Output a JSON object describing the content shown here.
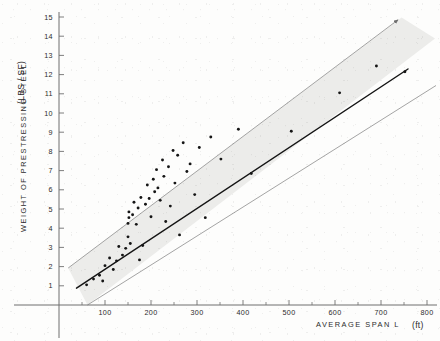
{
  "chart_data": {
    "type": "scatter",
    "title": "",
    "xlabel": "AVERAGE SPAN  L",
    "xunit": "(ft)",
    "ylabel": "WEIGHT OF PRESTRESSING STEEL",
    "yunit": "(LBS / SF)",
    "xlim": [
      0,
      800
    ],
    "ylim": [
      0,
      15
    ],
    "xticks": [
      100,
      200,
      300,
      400,
      500,
      600,
      700,
      800
    ],
    "xtick_labels": [
      "100",
      "200",
      "300",
      "400",
      "500",
      "600",
      "700",
      "800"
    ],
    "yticks": [
      1,
      2,
      3,
      4,
      5,
      6,
      7,
      8,
      9,
      10,
      11,
      12,
      13,
      14,
      15
    ],
    "ytick_labels": [
      "1",
      "2",
      "3",
      "4",
      "5",
      "6",
      "7",
      "8",
      "9",
      "10",
      "11",
      "12",
      "13",
      "14",
      "15"
    ],
    "x_minor_tick_step": 50,
    "grid": false,
    "legend": false,
    "series": [
      {
        "name": "observations",
        "marker": "filled-circle",
        "color": "#151515",
        "points": [
          [
            60,
            1.05
          ],
          [
            75,
            1.35
          ],
          [
            88,
            1.55
          ],
          [
            95,
            1.25
          ],
          [
            100,
            2.05
          ],
          [
            110,
            2.45
          ],
          [
            118,
            1.85
          ],
          [
            125,
            2.3
          ],
          [
            130,
            3.05
          ],
          [
            138,
            2.6
          ],
          [
            145,
            2.95
          ],
          [
            150,
            3.55
          ],
          [
            150,
            4.25
          ],
          [
            152,
            4.55
          ],
          [
            152,
            4.85
          ],
          [
            155,
            3.2
          ],
          [
            160,
            4.7
          ],
          [
            163,
            5.35
          ],
          [
            168,
            4.2
          ],
          [
            172,
            5.05
          ],
          [
            175,
            2.35
          ],
          [
            178,
            5.6
          ],
          [
            182,
            3.1
          ],
          [
            188,
            5.25
          ],
          [
            192,
            6.25
          ],
          [
            196,
            5.55
          ],
          [
            200,
            4.6
          ],
          [
            205,
            6.55
          ],
          [
            208,
            5.9
          ],
          [
            212,
            7.05
          ],
          [
            215,
            6.1
          ],
          [
            220,
            5.45
          ],
          [
            225,
            7.55
          ],
          [
            228,
            6.7
          ],
          [
            232,
            4.35
          ],
          [
            238,
            7.2
          ],
          [
            242,
            5.15
          ],
          [
            248,
            8.05
          ],
          [
            252,
            6.35
          ],
          [
            258,
            7.8
          ],
          [
            262,
            3.65
          ],
          [
            270,
            8.45
          ],
          [
            278,
            6.95
          ],
          [
            285,
            7.35
          ],
          [
            295,
            5.75
          ],
          [
            305,
            8.2
          ],
          [
            318,
            4.55
          ],
          [
            330,
            8.75
          ],
          [
            352,
            7.6
          ],
          [
            390,
            9.15
          ],
          [
            418,
            6.85
          ],
          [
            505,
            9.05
          ],
          [
            610,
            11.05
          ],
          [
            690,
            12.45
          ],
          [
            752,
            12.15
          ]
        ]
      }
    ],
    "trend_line": {
      "name": "regression-line",
      "x_start": 38,
      "y_start": 0.95,
      "x_end": 760,
      "y_end": 13.05,
      "color": "#141414"
    },
    "band": {
      "name": "scatter-band",
      "upper": {
        "x_start": 20,
        "y_start": 2.05,
        "x_end": 745,
        "y_end": 14.85
      },
      "lower": {
        "x_start": 62,
        "y_start": 0.0,
        "x_end": 800,
        "y_end": 12.15
      },
      "fill": "#ececea",
      "edge": "#8d8d8d",
      "arrow": true
    },
    "axis_color": "#6f6f6f",
    "background": "#fdfdfc"
  }
}
